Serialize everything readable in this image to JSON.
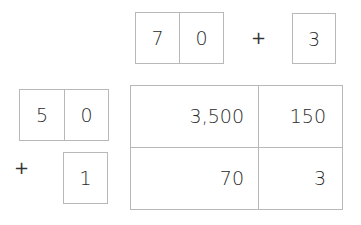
{
  "top_factor": {
    "digits": [
      "7",
      "0"
    ],
    "operator": "+",
    "addend": "3"
  },
  "left_factor": {
    "digits": [
      "5",
      "0"
    ],
    "operator": "+",
    "addend": "1"
  },
  "area_grid": {
    "rows": [
      [
        "3,500",
        "150"
      ],
      [
        "70",
        "3"
      ]
    ]
  }
}
